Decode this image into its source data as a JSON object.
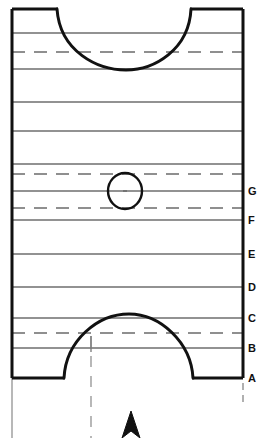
{
  "diagram": {
    "type": "engineering-section-drawing",
    "canvas": {
      "width": 263,
      "height": 438
    },
    "colors": {
      "outline": "#111111",
      "grid_line": "#6e6e6e",
      "dashed_line": "#8a8a8a",
      "centerline": "#9a9a9a",
      "background": "#ffffff",
      "label_text": "#111111"
    },
    "body_outline": {
      "name": "piston-section-outline",
      "left_x": 12,
      "right_x": 243,
      "top_y": 9,
      "bottom_y": 378,
      "stroke_width": 3
    },
    "top_arc": {
      "name": "top-concave-arc",
      "start_x": 57,
      "start_y": 9,
      "end_x": 191,
      "end_y": 9,
      "lowest_y": 69,
      "center_x": 126,
      "stroke_width": 3
    },
    "bottom_arc": {
      "name": "bottom-convex-arc",
      "start_x": 64,
      "start_y": 378,
      "end_x": 193,
      "end_y": 378,
      "peak_y": 314,
      "center_x": 128,
      "stroke_width": 3
    },
    "ellipse": {
      "name": "pin-bore-ellipse",
      "cx": 125,
      "cy": 191,
      "rx": 17,
      "ry": 18,
      "stroke_width": 2.2
    },
    "vertical_centerline": {
      "name": "lower-vertical-centerline",
      "x": 91,
      "y_top": 336,
      "y_bottom": 438
    },
    "right_stub_centerline": {
      "name": "right-lower-centerline-stub",
      "x": 243,
      "y_top": 382,
      "y_bottom": 406
    },
    "left_extension_line": {
      "name": "left-extension-line",
      "x": 12,
      "y_top": 378,
      "y_bottom": 438
    },
    "arrow": {
      "name": "section-direction-arrowhead",
      "tip_x": 131,
      "tip_y": 412,
      "half_width": 9,
      "base_y": 438
    },
    "solid_lines": [
      {
        "name": "grid-line-1",
        "y": 33
      },
      {
        "name": "grid-line-2",
        "y": 69
      },
      {
        "name": "grid-line-3",
        "y": 102
      },
      {
        "name": "grid-line-4",
        "y": 131
      },
      {
        "name": "grid-line-5",
        "y": 164
      },
      {
        "name": "grid-line-g",
        "y": 191
      },
      {
        "name": "grid-line-f",
        "y": 220
      },
      {
        "name": "grid-line-e",
        "y": 254
      },
      {
        "name": "grid-line-d",
        "y": 287
      },
      {
        "name": "grid-line-c",
        "y": 318
      },
      {
        "name": "grid-line-b",
        "y": 348
      }
    ],
    "dashed_lines": [
      {
        "name": "dashed-line-1",
        "y": 52
      },
      {
        "name": "dashed-line-2",
        "y": 174
      },
      {
        "name": "dashed-line-3",
        "y": 208
      },
      {
        "name": "dashed-line-4",
        "y": 333
      }
    ],
    "level_labels": [
      {
        "id": "G",
        "text": "G",
        "y": 191
      },
      {
        "id": "F",
        "text": "F",
        "y": 220
      },
      {
        "id": "E",
        "text": "E",
        "y": 254
      },
      {
        "id": "D",
        "text": "D",
        "y": 287
      },
      {
        "id": "C",
        "text": "C",
        "y": 318
      },
      {
        "id": "B",
        "text": "B",
        "y": 348
      },
      {
        "id": "A",
        "text": "A",
        "y": 378
      }
    ]
  }
}
